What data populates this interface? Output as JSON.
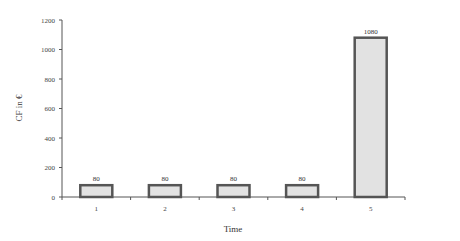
{
  "chart_data": {
    "type": "bar",
    "title": "",
    "xlabel": "Time",
    "ylabel": "CF in €",
    "categories": [
      "1",
      "2",
      "3",
      "4",
      "5"
    ],
    "values": [
      80,
      80,
      80,
      80,
      1080
    ],
    "data_labels": [
      "80",
      "80",
      "80",
      "80",
      "1080"
    ],
    "ylim": [
      0,
      1200
    ],
    "yticks": [
      0,
      200,
      400,
      600,
      800,
      1000,
      1200
    ],
    "grid": false,
    "legend": null,
    "colors": {
      "bar_fill": "#e2e2e2",
      "bar_stroke": "#555555",
      "axis": "#555555"
    }
  }
}
